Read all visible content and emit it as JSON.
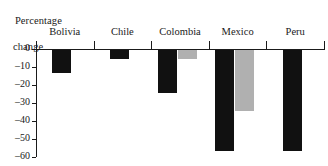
{
  "chart_data": {
    "type": "bar",
    "title": "Percentage change",
    "title_line1": "Percentage",
    "title_line2": "change",
    "xlabel": "",
    "ylabel": "Percentage change",
    "categories": [
      "Bolivia",
      "Chile",
      "Colombia",
      "Mexico",
      "Peru"
    ],
    "series": [
      {
        "name": "black",
        "color": "#111111",
        "values": [
          -12.5,
          -5.0,
          -24.0,
          -56.0,
          -56.0
        ]
      },
      {
        "name": "gray",
        "color": "#b0b0b0",
        "values": [
          null,
          null,
          -5.0,
          -34.0,
          null
        ]
      }
    ],
    "ylim": [
      -60,
      0
    ],
    "yticks": [
      0,
      -10,
      -20,
      -30,
      -40,
      -50,
      -60
    ],
    "ytick_labels": [
      "0",
      "–10",
      "–20",
      "–30",
      "–40",
      "–50",
      "–60"
    ],
    "grid": false,
    "legend": null
  },
  "colors": {
    "black_bar": "#111111",
    "gray_bar": "#b0b0b0",
    "axis": "#1a1a1a",
    "background": "#ffffff"
  }
}
